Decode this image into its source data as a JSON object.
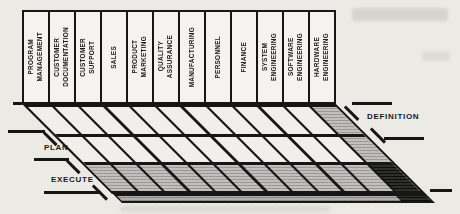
{
  "matrix": {
    "columns": [
      {
        "label": "PROGRAM\nMANAGEMENT"
      },
      {
        "label": "CUSTOMER\nDOCUMENTATION"
      },
      {
        "label": "CUSTOMER\nSUPPORT"
      },
      {
        "label": "SALES"
      },
      {
        "label": "PRODUCT\nMARKETING"
      },
      {
        "label": "QUALITY\nASSURANCE"
      },
      {
        "label": "MANUFACTURING"
      },
      {
        "label": "PERSONNEL"
      },
      {
        "label": "FINANCE"
      },
      {
        "label": "SYSTEM\nENGINEERING"
      },
      {
        "label": "SOFTWARE\nENGINEERING"
      },
      {
        "label": "HARDWARE\nENGINEERING"
      }
    ],
    "phases": [
      {
        "label": "DEFINITION",
        "label_side": "right",
        "shaded": false
      },
      {
        "label": "PLAN",
        "label_side": "left",
        "shaded": false
      },
      {
        "label": "EXECUTE",
        "label_side": "left",
        "shaded": true
      }
    ],
    "highlight": {
      "shaded_column_index": 11,
      "shaded_column_label": "HARDWARE\nENGINEERING",
      "dark_cell_phase_index": 2,
      "dark_cell_phase_label": "EXECUTE"
    }
  },
  "colors": {
    "line": "#161616",
    "background": "#eceae5",
    "shade_gray": "#c9c8c4",
    "shade_dark": "#343432"
  }
}
